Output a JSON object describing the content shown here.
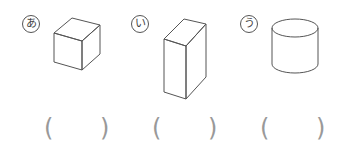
{
  "items": [
    {
      "label": "あ",
      "shape": "cube"
    },
    {
      "label": "い",
      "shape": "rectangular-prism"
    },
    {
      "label": "う",
      "shape": "cylinder"
    }
  ],
  "answers": {
    "open": "(",
    "close": ")"
  }
}
